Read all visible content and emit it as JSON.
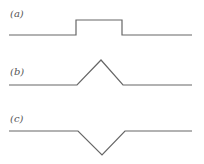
{
  "panels": [
    {
      "label": "(a)",
      "shape": "rectangular-pulse",
      "points": [
        [
          9,
          35
        ],
        [
          76,
          35
        ],
        [
          76,
          20
        ],
        [
          122,
          20
        ],
        [
          122,
          35
        ],
        [
          192,
          35
        ]
      ]
    },
    {
      "label": "(b)",
      "shape": "triangular-peak",
      "points": [
        [
          9,
          85
        ],
        [
          77,
          85
        ],
        [
          101,
          60
        ],
        [
          123,
          85
        ],
        [
          192,
          85
        ]
      ]
    },
    {
      "label": "(c)",
      "shape": "inverted-triangular-dip",
      "points": [
        [
          9,
          131
        ],
        [
          78,
          131
        ],
        [
          102,
          155
        ],
        [
          125,
          131
        ],
        [
          192,
          131
        ]
      ]
    }
  ],
  "colors": {
    "stroke": "#666666",
    "label": "#555555",
    "background": "#ffffff"
  }
}
